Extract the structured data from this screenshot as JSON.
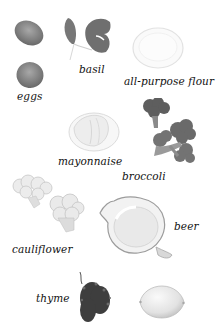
{
  "ingredients": [
    {
      "id": "eggs",
      "label": "eggs",
      "icon": "egg-icon"
    },
    {
      "id": "basil",
      "label": "basil",
      "icon": "basil-leaf-icon"
    },
    {
      "id": "flour",
      "label": "all-purpose flour",
      "icon": "flour-bowl-icon"
    },
    {
      "id": "mayonnaise",
      "label": "mayonnaise",
      "icon": "mayonnaise-bowl-icon"
    },
    {
      "id": "broccoli",
      "label": "broccoli",
      "icon": "broccoli-icon"
    },
    {
      "id": "cauliflower",
      "label": "cauliflower",
      "icon": "cauliflower-icon"
    },
    {
      "id": "beer",
      "label": "beer",
      "icon": "beer-pitcher-icon"
    },
    {
      "id": "thyme",
      "label": "thyme",
      "icon": "thyme-sprig-icon"
    },
    {
      "id": "lemon",
      "label": "",
      "icon": "lemon-icon"
    }
  ]
}
